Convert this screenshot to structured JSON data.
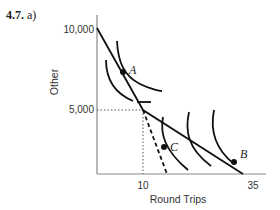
{
  "problem": {
    "number": "4.7.",
    "part": "a)"
  },
  "axes": {
    "x_label": "Round Trips",
    "y_label": "Other",
    "x_ticks": [
      "10",
      "35"
    ],
    "y_ticks": [
      "10,000",
      "5,000"
    ]
  },
  "points": {
    "a": "A",
    "b": "B",
    "c": "C"
  },
  "colors": {
    "line": "#111111",
    "axis": "#888888",
    "guide": "#555555"
  }
}
